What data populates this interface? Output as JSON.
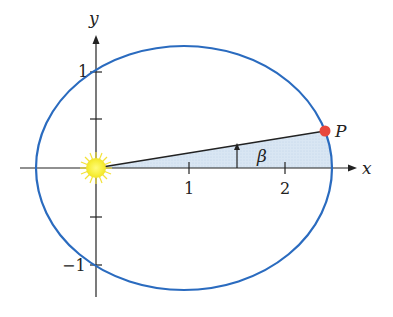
{
  "figure": {
    "type": "ellipse-orbit-diagram",
    "axes": {
      "x_label": "x",
      "y_label": "y",
      "x_ticks": [
        {
          "value": 1,
          "label": "1"
        },
        {
          "value": 2,
          "label": "2"
        }
      ],
      "y_ticks": [
        {
          "value": 1,
          "label": "1"
        },
        {
          "value": 0.5,
          "label": ""
        },
        {
          "value": -0.5,
          "label": ""
        },
        {
          "value": -1,
          "label": "−1"
        }
      ]
    },
    "ellipse": {
      "center_x": 0.93,
      "center_y": 0,
      "semi_major": 1.55,
      "semi_minor": 1.27,
      "color": "#2a6bbf"
    },
    "sun": {
      "name": "sun-at-focus",
      "x": 0,
      "y": 0,
      "color": "#f7ef3a"
    },
    "point": {
      "label": "P",
      "x": 2.42,
      "y": 0.39,
      "color": "#e8473c"
    },
    "angle": {
      "label": "β",
      "shading_color": "#d6e4f2"
    }
  }
}
